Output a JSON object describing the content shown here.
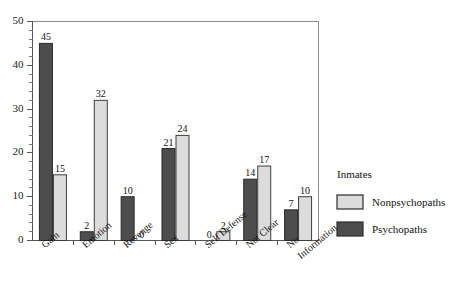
{
  "chart_data": {
    "type": "bar",
    "title": "",
    "subtitle": "",
    "xlabel": "",
    "ylabel": "",
    "ylim": [
      0,
      50
    ],
    "y_major_ticks": [
      0,
      10,
      20,
      30,
      40,
      50
    ],
    "y_minor_step": 2,
    "grid": false,
    "legend_position": "right",
    "legend_title": "Inmates",
    "categories": [
      "Gain",
      "Emotion",
      "Revenge",
      "Sex",
      "Self Defense",
      "Not Clear",
      "No Information"
    ],
    "category_lines": [
      [
        "Gain"
      ],
      [
        "Emotion"
      ],
      [
        "Revenge"
      ],
      [
        "Sex"
      ],
      [
        "Self Defense"
      ],
      [
        "Not Clear"
      ],
      [
        "No",
        "Information"
      ]
    ],
    "series": [
      {
        "name": "Psychopaths",
        "color": "#4d4d4d",
        "values": [
          45,
          2,
          10,
          21,
          0,
          14,
          7
        ]
      },
      {
        "name": "Nonpsychopaths",
        "color": "#dcdcdc",
        "values": [
          15,
          32,
          0,
          24,
          2,
          17,
          10
        ]
      }
    ],
    "value_labels": {
      "Psychopaths": [
        "45",
        "2",
        "10",
        "21",
        "0",
        "14",
        "7"
      ],
      "Nonpsychopaths": [
        "15",
        "32",
        "0",
        "24",
        "2",
        "17",
        "10"
      ]
    }
  },
  "legend": {
    "title": "Inmates",
    "entries": [
      {
        "label": "Nonpsychopaths",
        "swatch": "light"
      },
      {
        "label": "Psychopaths",
        "swatch": "dark"
      }
    ]
  },
  "axis": {
    "y_labels": [
      "50",
      "40",
      "30",
      "20",
      "10",
      "0"
    ]
  }
}
